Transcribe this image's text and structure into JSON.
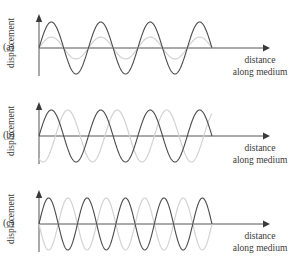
{
  "figure": {
    "background_color": "#ffffff",
    "width": 303,
    "height": 264
  },
  "axis_labels": {
    "y": "displacement",
    "x_line1": "distance",
    "x_line2": "along medium"
  },
  "panels": [
    {
      "label": "(a)",
      "description": "two waves in phase, second wave smaller amplitude"
    },
    {
      "label": "(b)",
      "description": "two waves of equal amplitude, phase shifted"
    },
    {
      "label": "(c)",
      "description": "two waves of equal amplitude, exactly out of phase"
    }
  ],
  "colors": {
    "wave_dark": "#4a4a4a",
    "wave_light": "#d2d2d2",
    "axis": "#555555",
    "text": "#3a3a3a"
  },
  "chart_data": {
    "type": "line",
    "xlabel": "distance along medium",
    "ylabel": "displacement",
    "grid": false,
    "legend": "none",
    "panels": [
      {
        "id": "a",
        "label": "(a)",
        "xlim": [
          0,
          1
        ],
        "ylim": [
          -1,
          1
        ],
        "series": [
          {
            "name": "wave-1",
            "color": "#4a4a4a",
            "amplitude": 1.0,
            "cycles": 3.5,
            "phase_deg": 0
          },
          {
            "name": "wave-2",
            "color": "#d2d2d2",
            "amplitude": 0.42,
            "cycles": 3.5,
            "phase_deg": 0
          }
        ]
      },
      {
        "id": "b",
        "label": "(b)",
        "xlim": [
          0,
          1
        ],
        "ylim": [
          -1,
          1
        ],
        "series": [
          {
            "name": "wave-1",
            "color": "#4a4a4a",
            "amplitude": 1.0,
            "cycles": 3.5,
            "phase_deg": 0
          },
          {
            "name": "wave-2",
            "color": "#d2d2d2",
            "amplitude": 1.0,
            "cycles": 3.5,
            "phase_deg": -120
          }
        ]
      },
      {
        "id": "c",
        "label": "(c)",
        "xlim": [
          0,
          1
        ],
        "ylim": [
          -1,
          1
        ],
        "series": [
          {
            "name": "wave-1",
            "color": "#4a4a4a",
            "amplitude": 1.0,
            "cycles": 4.5,
            "phase_deg": 0
          },
          {
            "name": "wave-2",
            "color": "#d2d2d2",
            "amplitude": 1.0,
            "cycles": 4.5,
            "phase_deg": 180
          }
        ]
      }
    ]
  }
}
